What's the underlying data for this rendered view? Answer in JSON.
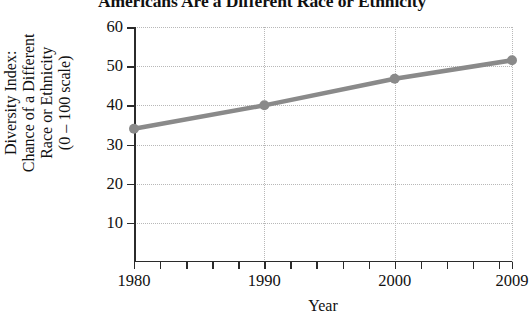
{
  "chart_data": {
    "type": "line",
    "title": "Americans Are a Different Race or Ethnicity",
    "xlabel": "Year",
    "ylabel": "Diversity Index:\nChance of a Different\nRace or Ethnicity\n(0 – 100 scale)",
    "ylabel_lines": [
      "Diversity Index:",
      "Chance of a Different",
      "Race or Ethnicity",
      "(0 – 100 scale)"
    ],
    "x": [
      1980,
      1990,
      2000,
      2009
    ],
    "values": [
      34,
      40,
      46.8,
      51.5
    ],
    "series": [
      {
        "name": "Diversity Index",
        "x": [
          1980,
          1990,
          2000,
          2009
        ],
        "values": [
          34,
          40,
          46.8,
          51.5
        ],
        "color": "#8a8a8a",
        "marker": "circle"
      }
    ],
    "xlim": [
      1980,
      2009
    ],
    "ylim": [
      0,
      60
    ],
    "yticks": [
      10,
      20,
      30,
      40,
      50,
      60
    ],
    "ytick_labels": [
      "10",
      "20",
      "30",
      "40",
      "50",
      "60"
    ],
    "xticks": [
      1980,
      1990,
      2000,
      2009
    ],
    "xtick_labels": [
      "1980",
      "1990",
      "2000",
      "2009"
    ],
    "x_minor_ticks": [
      1980,
      1982,
      1984,
      1986,
      1988,
      1990,
      1992,
      1994,
      1996,
      1998,
      2000,
      2002,
      2004,
      2006,
      2008,
      2009
    ],
    "gridlines": {
      "horizontal": [
        10,
        20,
        30,
        40,
        50,
        60
      ],
      "vertical": [
        1990,
        2000,
        2009
      ],
      "style": "dotted",
      "color": "#b8b8b8"
    },
    "legend": null,
    "legend_position": "none",
    "annotations": [],
    "colors": {
      "line": "#8a8a8a",
      "marker": "#8a8a8a",
      "axis": "#2b2b2b",
      "grid": "#b8b8b8",
      "text": "#111111",
      "background": "#ffffff"
    }
  }
}
